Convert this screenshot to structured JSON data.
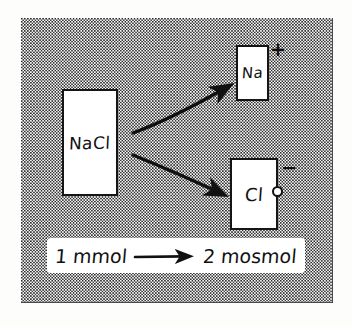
{
  "diagram": {
    "style": "hand-drawn pencil sketch on stippled background",
    "background_color": "#fefefe",
    "stipple_color": "#2b2b2b",
    "ink_color": "#111111",
    "boxes": [
      {
        "id": "nacl",
        "label": "NaCl",
        "role": "solute-compound",
        "charge": ""
      },
      {
        "id": "na",
        "label": "Na",
        "role": "cation-product",
        "charge": "+"
      },
      {
        "id": "cl",
        "label": "Cl",
        "role": "anion-product",
        "charge": "−"
      }
    ],
    "arrows": [
      {
        "id": "arrow-to-na",
        "from": "nacl",
        "to": "na",
        "direction": "up-right"
      },
      {
        "id": "arrow-to-cl",
        "from": "nacl",
        "to": "cl",
        "direction": "down-right"
      }
    ],
    "caption": {
      "left_value": "1 mmol",
      "arrow": "⟶",
      "right_value": "2 mosmol"
    }
  }
}
